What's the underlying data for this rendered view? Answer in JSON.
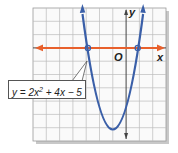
{
  "diagram": {
    "equation": {
      "lhs": "y = 2x",
      "exponent": "2",
      "rhs": " + 4x − 5"
    },
    "axes": {
      "x_label": "x",
      "y_label": "y",
      "origin_label": "O",
      "x_range": [
        -7,
        3
      ],
      "y_range": [
        -7,
        3
      ],
      "grid": true
    },
    "roots": [
      -2.87,
      0.87
    ],
    "vertex": [
      -1,
      -7
    ],
    "colors": {
      "parabola": "#3a5fa8",
      "x_axis_line": "#e8602c",
      "grid": "#b8b8b8",
      "axis": "#444444",
      "shadow": "#bfbfbf"
    }
  }
}
